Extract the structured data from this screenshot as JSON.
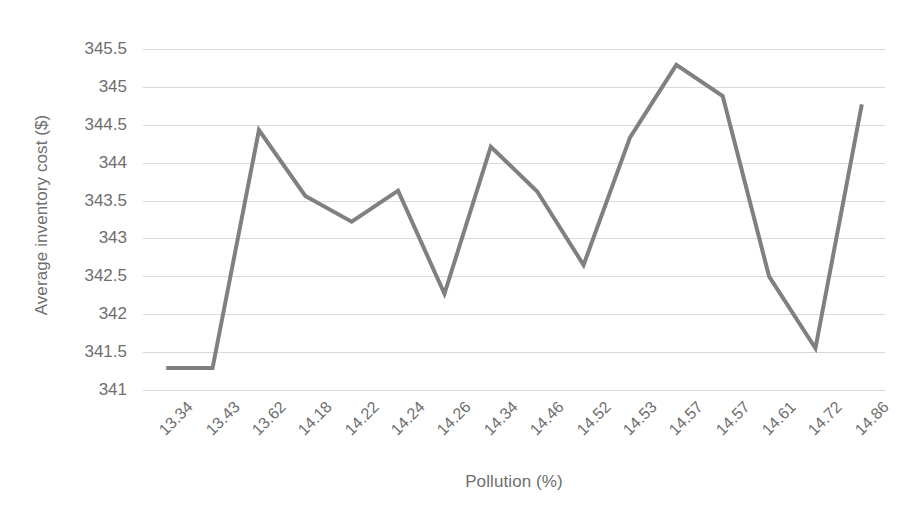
{
  "chart_data": {
    "type": "line",
    "title": "",
    "xlabel": "Pollution (%)",
    "ylabel": "Average inventory cost ($)",
    "categories": [
      "13.34",
      "13.43",
      "13.62",
      "14.18",
      "14.22",
      "14.24",
      "14.26",
      "14.34",
      "14.46",
      "14.52",
      "14.53",
      "14.57",
      "14.57",
      "14.61",
      "14.72",
      "14.86"
    ],
    "values": [
      341.29,
      341.29,
      344.43,
      343.56,
      343.22,
      343.63,
      342.27,
      344.21,
      343.62,
      342.65,
      344.33,
      345.29,
      344.88,
      342.5,
      341.55,
      344.77
    ],
    "series": [
      {
        "name": "Average inventory cost",
        "color": "#808080",
        "values": [
          341.29,
          341.29,
          344.43,
          343.56,
          343.22,
          343.63,
          342.27,
          344.21,
          343.62,
          342.65,
          344.33,
          345.29,
          344.88,
          342.5,
          341.55,
          344.77
        ]
      }
    ],
    "ylim": [
      341,
      345.5
    ],
    "y_ticks": [
      "345.5",
      "345",
      "344.5",
      "344",
      "343.5",
      "343",
      "342.5",
      "342",
      "341.5",
      "341"
    ],
    "y_tick_values": [
      345.5,
      345,
      344.5,
      344,
      343.5,
      343,
      342.5,
      342,
      341.5,
      341
    ],
    "grid": true,
    "grid_color": "#d6d9de",
    "legend": "none",
    "x_tick_rotation": -45,
    "background": "#ffffff",
    "text_color": "#6e6e6e",
    "line_width": 4
  }
}
